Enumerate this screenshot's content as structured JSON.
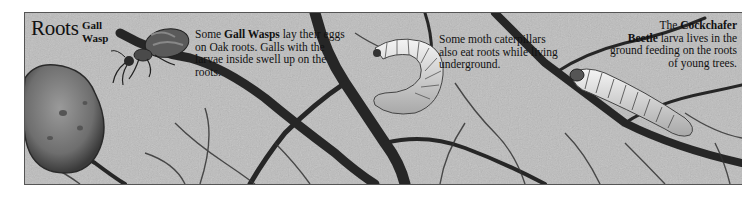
{
  "panel": {
    "title": "Roots",
    "gall_wasp_label_line1": "Gall",
    "gall_wasp_label_line2": "Wasp"
  },
  "captions": {
    "gall_wasp": {
      "prefix": "Some ",
      "bold": "Gall Wasps",
      "suffix": " lay their eggs on Oak roots. Galls with the larvae inside swell up on the roots."
    },
    "moth": {
      "text": "Some moth caterpillars also eat roots while living underground."
    },
    "cockchafer": {
      "prefix": "The ",
      "bold1": "Cockchafer",
      "mid": " ",
      "bold2": "Beetle",
      "suffix": " larva lives in the ground feeding on the roots of young trees."
    }
  },
  "illustrations": [
    {
      "name": "gall-wasp",
      "description": "Gall wasp insect on root"
    },
    {
      "name": "oak-root-gall",
      "description": "Large rounded gall on root"
    },
    {
      "name": "moth-caterpillar",
      "description": "Curled moth caterpillar"
    },
    {
      "name": "cockchafer-larva",
      "description": "Cockchafer beetle larva on root"
    }
  ],
  "colors": {
    "soil": "#b9b9b9",
    "roots": "#2a2a2a",
    "text": "#111111"
  }
}
